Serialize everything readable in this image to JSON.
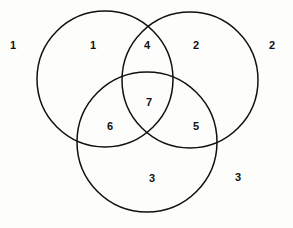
{
  "diagram": {
    "type": "venn-diagram",
    "title": "",
    "sets": 3,
    "stroke_color": "#101010",
    "stroke_width": 1.5,
    "fill": "none",
    "background_color": "#fdfdfc",
    "label_color": "#101010",
    "circles": [
      {
        "name": "left-circle",
        "cx": 105,
        "cy": 79,
        "r": 68
      },
      {
        "name": "right-circle",
        "cx": 190,
        "cy": 80,
        "r": 68
      },
      {
        "name": "bottom-circle",
        "cx": 147,
        "cy": 142,
        "r": 70
      }
    ],
    "regions": [
      {
        "id": "outside",
        "label": "1",
        "x": 13,
        "y": 45
      },
      {
        "id": "left-only",
        "label": "1",
        "x": 93,
        "y": 45
      },
      {
        "id": "left-right",
        "label": "4",
        "x": 147,
        "y": 45
      },
      {
        "id": "right-only",
        "label": "2",
        "x": 196,
        "y": 45
      },
      {
        "id": "outside-right",
        "label": "2",
        "x": 272,
        "y": 45
      },
      {
        "id": "all-three",
        "label": "7",
        "x": 149,
        "y": 102
      },
      {
        "id": "left-bottom",
        "label": "6",
        "x": 110,
        "y": 126
      },
      {
        "id": "right-bottom",
        "label": "5",
        "x": 196,
        "y": 126
      },
      {
        "id": "bottom-only",
        "label": "3",
        "x": 152,
        "y": 178
      },
      {
        "id": "outside-bottom-right",
        "label": "3",
        "x": 238,
        "y": 177
      }
    ]
  }
}
